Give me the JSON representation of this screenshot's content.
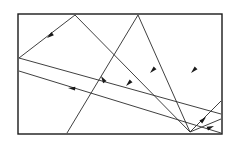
{
  "figure": {
    "canvas": {
      "width": 232,
      "height": 144
    },
    "background_color": "#ffffff",
    "stroke_color": "#2a2a2a",
    "frame_color": "#1a1a1a",
    "arrow_color": "#1a1a1a",
    "frame": {
      "x": 18,
      "y": 14,
      "width": 204,
      "height": 120
    },
    "convergence_point": {
      "x": 190,
      "y": 132
    },
    "segments": [
      {
        "name": "segment-top-left-apex-to-convergence",
        "x1": 75,
        "y1": 15,
        "x2": 190,
        "y2": 132
      },
      {
        "name": "segment-top-left-apex-to-left-edge",
        "x1": 75,
        "y1": 15,
        "x2": 19,
        "y2": 58
      },
      {
        "name": "segment-top-mid-apex-to-convergence",
        "x1": 138,
        "y1": 15,
        "x2": 190,
        "y2": 132
      },
      {
        "name": "segment-top-mid-apex-to-bottom-edge",
        "x1": 138,
        "y1": 15,
        "x2": 67,
        "y2": 133
      },
      {
        "name": "segment-left-edge-to-right-edge-upper",
        "x1": 19,
        "y1": 58,
        "x2": 221,
        "y2": 114
      },
      {
        "name": "segment-left-edge-to-right-edge-lower",
        "x1": 19,
        "y1": 71,
        "x2": 221,
        "y2": 133
      },
      {
        "name": "segment-convergence-to-right-edge-upper",
        "x1": 190,
        "y1": 132,
        "x2": 221,
        "y2": 101
      },
      {
        "name": "segment-convergence-to-right-edge-lower",
        "x1": 190,
        "y1": 132,
        "x2": 221,
        "y2": 119
      }
    ],
    "arrows": [
      {
        "name": "arrow-upper-left",
        "x": 47,
        "y": 38,
        "angle": 142
      },
      {
        "name": "arrow-mid-left",
        "x": 68,
        "y": 88,
        "angle": 185
      },
      {
        "name": "arrow-center-vertical",
        "x": 101,
        "y": 76,
        "angle": 238
      },
      {
        "name": "arrow-center-lower",
        "x": 126,
        "y": 86,
        "angle": 135
      },
      {
        "name": "arrow-center-upper",
        "x": 150,
        "y": 73,
        "angle": 135
      },
      {
        "name": "arrow-right-upper",
        "x": 191,
        "y": 73,
        "angle": 135
      },
      {
        "name": "arrow-right-lower",
        "x": 206,
        "y": 117,
        "angle": 316
      },
      {
        "name": "arrow-bottom-right",
        "x": 214,
        "y": 126,
        "angle": 338
      }
    ]
  }
}
